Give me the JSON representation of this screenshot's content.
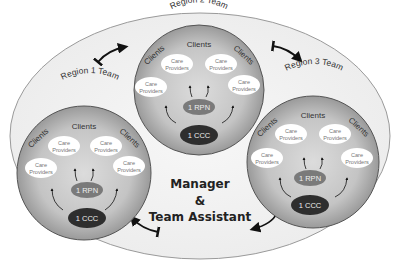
{
  "diagram": {
    "center_label": {
      "line1": "Manager",
      "line2": "&",
      "line3": "Team Assistant"
    },
    "teams": [
      {
        "title": "Region 1 Team",
        "clients_top": "Clients",
        "clients_left": "Clients",
        "clients_right": "Clients",
        "care_providers": [
          "Care Providers",
          "Care Providers",
          "Care Providers",
          "Care Providers"
        ],
        "care_line1": "Care",
        "care_line2": "Providers",
        "rpn": "1 RPN",
        "ccc": "1 CCC"
      },
      {
        "title": "Region 2 Team",
        "clients_top": "Clients",
        "clients_left": "Clients",
        "clients_right": "Clients",
        "care_providers": [
          "Care Providers",
          "Care Providers",
          "Care Providers",
          "Care Providers"
        ],
        "care_line1": "Care",
        "care_line2": "Providers",
        "rpn": "1 RPN",
        "ccc": "1 CCC"
      },
      {
        "title": "Region 3 Team",
        "clients_top": "Clients",
        "clients_left": "Clients",
        "clients_right": "Clients",
        "care_providers": [
          "Care Providers",
          "Care Providers",
          "Care Providers",
          "Care Providers"
        ],
        "care_line1": "Care",
        "care_line2": "Providers",
        "rpn": "1 RPN",
        "ccc": "1 CCC"
      }
    ],
    "colors": {
      "outer_fill": "#f2f2f2",
      "circle_edge": "#8a8a8a",
      "circle_center": "#d4d4d4",
      "rpn_fill": "#7a7a7a",
      "ccc_fill": "#333333",
      "care_fill": "#ffffff"
    }
  }
}
